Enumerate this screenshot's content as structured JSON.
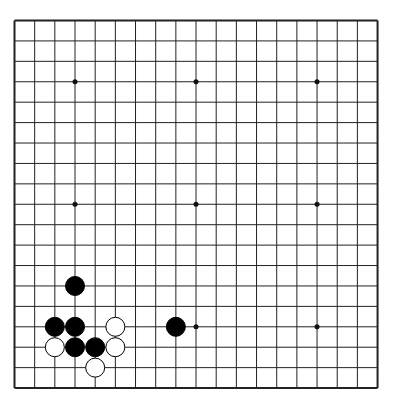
{
  "board": {
    "size": 19,
    "origin_x": 14.5,
    "origin_y": 20.5,
    "spacing_x": 20.17,
    "spacing_y": 20.42,
    "line_color": "#222222",
    "border_width": 2,
    "star_points": [
      [
        3,
        3
      ],
      [
        9,
        3
      ],
      [
        15,
        3
      ],
      [
        3,
        9
      ],
      [
        9,
        9
      ],
      [
        15,
        9
      ],
      [
        3,
        15
      ],
      [
        9,
        15
      ],
      [
        15,
        15
      ]
    ],
    "stones": [
      {
        "color": "black",
        "col": 3,
        "row": 13
      },
      {
        "color": "black",
        "col": 2,
        "row": 15
      },
      {
        "color": "black",
        "col": 3,
        "row": 15
      },
      {
        "color": "white",
        "col": 5,
        "row": 15
      },
      {
        "color": "black",
        "col": 8,
        "row": 15
      },
      {
        "color": "white",
        "col": 2,
        "row": 16
      },
      {
        "color": "black",
        "col": 3,
        "row": 16
      },
      {
        "color": "black",
        "col": 4,
        "row": 16
      },
      {
        "color": "white",
        "col": 5,
        "row": 16
      },
      {
        "color": "white",
        "col": 4,
        "row": 17
      }
    ]
  }
}
